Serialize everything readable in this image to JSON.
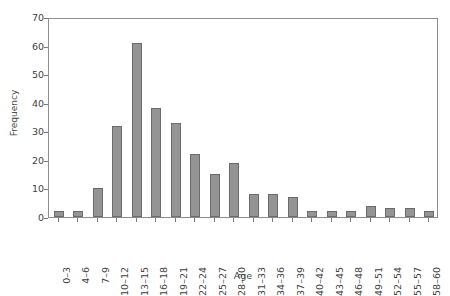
{
  "chart_data": {
    "type": "bar",
    "title": "",
    "xlabel": "Age",
    "ylabel": "Frequency",
    "categories": [
      "0–3",
      "4–6",
      "7–9",
      "10–12",
      "13–15",
      "16–18",
      "19–21",
      "22–24",
      "25–27",
      "28–30",
      "31–33",
      "34–36",
      "37–39",
      "40–42",
      "43–45",
      "46–48",
      "49–51",
      "52–54",
      "55–57",
      "58–60"
    ],
    "values": [
      2,
      2,
      10,
      32,
      61,
      38,
      33,
      22,
      15,
      19,
      8,
      8,
      7,
      2,
      2,
      2,
      4,
      3,
      3,
      2
    ],
    "ylim": [
      0,
      70
    ],
    "yticks": [
      0,
      10,
      20,
      30,
      40,
      50,
      60,
      70
    ],
    "ytick_labels": [
      "0",
      "10",
      "20",
      "30",
      "40",
      "50",
      "60",
      "70"
    ],
    "grid": false,
    "legend": null,
    "bar_color": "#949494",
    "bar_edge_color": "#6b6b6b",
    "axis_color": "#8d8d8d",
    "text_color": "#3f3f3f"
  }
}
